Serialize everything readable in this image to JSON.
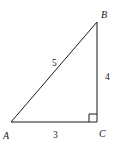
{
  "figure": {
    "name": "right-triangle-3-4-5",
    "background_color": "#ffffff",
    "stroke_color": "#1a1a1a",
    "stroke_width": 1,
    "width": 116,
    "height": 147
  },
  "vertices": {
    "a": {
      "label": "A",
      "x": 11,
      "y": 122,
      "label_x": 3,
      "label_y": 139
    },
    "b": {
      "label": "B",
      "x": 97,
      "y": 22,
      "label_x": 101,
      "label_y": 18
    },
    "c": {
      "label": "C",
      "x": 97,
      "y": 122,
      "label_x": 99,
      "label_y": 137
    }
  },
  "sides": {
    "hypotenuse": {
      "label": "5",
      "label_x": 52,
      "label_y": 66,
      "from": "A",
      "to": "B"
    },
    "vertical": {
      "label": "4",
      "label_x": 105,
      "label_y": 80,
      "from": "B",
      "to": "C"
    },
    "base": {
      "label": "3",
      "label_x": 53,
      "label_y": 138,
      "from": "A",
      "to": "C"
    }
  },
  "right_angle_marker": {
    "name": "right-angle-square",
    "at_vertex": "C",
    "size": 8,
    "x": 89,
    "y": 114
  },
  "geometry_paths": {
    "triangle": "M 11 122 L 97 22 L 97 122 Z",
    "right_angle": "M 89 122 L 89 114 L 97 114"
  }
}
